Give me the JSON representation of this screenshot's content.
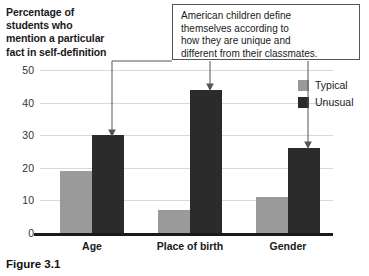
{
  "chart_data": {
    "type": "bar",
    "title": "",
    "ylabel": "Percentage of students who mention a particular fact in self-definition",
    "xlabel": "",
    "ylim": [
      0,
      50
    ],
    "yticks": [
      0,
      10,
      20,
      30,
      40,
      50
    ],
    "grid": true,
    "legend_position": "right",
    "categories": [
      "Age",
      "Place of birth",
      "Gender"
    ],
    "series": [
      {
        "name": "Typical",
        "color": "#9a9a9a",
        "values": [
          19,
          7,
          11
        ]
      },
      {
        "name": "Unusual",
        "color": "#2b2b2b",
        "values": [
          30,
          44,
          26
        ]
      }
    ],
    "annotations": [
      {
        "text": "American children define themselves according to how they are unique and different from their classmates.",
        "lines": [
          "American children define",
          "themselves according to",
          "how they are unique and",
          "different from their classmates."
        ],
        "points_to": [
          "Unusual/Age",
          "Unusual/Place of birth",
          "Unusual/Gender"
        ]
      }
    ]
  },
  "axis": {
    "ytitle_lines": [
      "Percentage of",
      "students who",
      "mention a particular",
      "fact in self-definition"
    ],
    "yticks": [
      "50",
      "40",
      "30",
      "20",
      "10",
      "0"
    ]
  },
  "legend": {
    "items": [
      {
        "label": "Typical",
        "color": "#9a9a9a"
      },
      {
        "label": "Unusual",
        "color": "#2b2b2b"
      }
    ]
  },
  "caption": {
    "text": "Figure 3.1"
  },
  "colors": {
    "typical": "#9a9a9a",
    "unusual": "#2b2b2b",
    "gridline": "#d8d8d8",
    "axis": "#1a1a1a"
  }
}
